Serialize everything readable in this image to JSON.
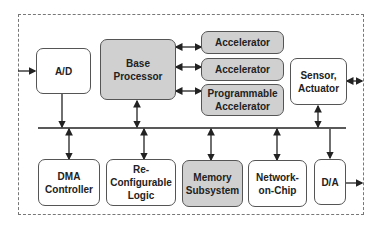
{
  "diagram": {
    "blocks": {
      "ad": "A/D",
      "base_processor": "Base\nProcessor",
      "accelerator_1": "Accelerator",
      "accelerator_2": "Accelerator",
      "programmable_accelerator": "Programmable\nAccelerator",
      "sensor_actuator": "Sensor,\nActuator",
      "dma_controller": "DMA\nController",
      "reconfigurable_logic": "Re-\nConfigurable\nLogic",
      "memory_subsystem": "Memory\nSubsystem",
      "network_on_chip": "Network-\non-Chip",
      "da": "D/A"
    },
    "colors": {
      "highlight_fill": "#d0d0d0",
      "plain_fill": "#ffffff",
      "stroke": "#555555"
    }
  }
}
